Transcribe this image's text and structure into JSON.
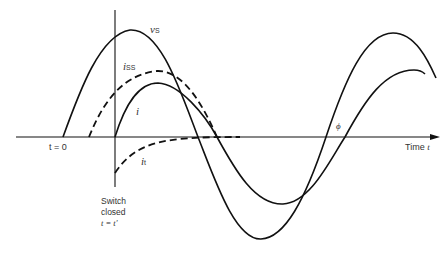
{
  "diagram": {
    "title": "",
    "curves": [
      {
        "id": "vs",
        "label_main": "v",
        "label_sub": "S",
        "style": "solid",
        "description": "source voltage"
      },
      {
        "id": "iss",
        "label_main": "i",
        "label_sub": "SS",
        "style": "dashed",
        "description": "steady-state current"
      },
      {
        "id": "i",
        "label_main": "i",
        "label_sub": "",
        "style": "solid",
        "description": "total current"
      },
      {
        "id": "it",
        "label_main": "i",
        "label_sub": "t",
        "style": "dashed",
        "description": "transient current"
      }
    ],
    "axis": {
      "label": "Time ",
      "label_var": "t"
    },
    "markers": {
      "t0": "t = 0",
      "switch_line1": "Switch",
      "switch_line2": "closed",
      "switch_line3": "t = t′",
      "phase": "ϕ"
    },
    "colors": {
      "line": "#111111",
      "text": "#333333",
      "background": "#ffffff"
    }
  }
}
